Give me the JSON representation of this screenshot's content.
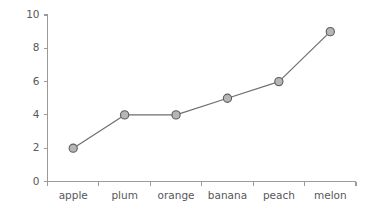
{
  "chart_data": {
    "type": "line",
    "title": "",
    "subtitle": "",
    "xlabel": "",
    "ylabel": "",
    "categories": [
      "apple",
      "plum",
      "orange",
      "banana",
      "peach",
      "melon"
    ],
    "values": [
      2,
      4,
      4,
      5,
      6,
      9
    ],
    "series": [
      {
        "name": "",
        "values": [
          2,
          4,
          4,
          5,
          6,
          9
        ]
      }
    ],
    "ylim": [
      0,
      10
    ],
    "ytick_labels": [
      "0",
      "2",
      "4",
      "6",
      "8",
      "10"
    ],
    "ytick_values": [
      0,
      2,
      4,
      6,
      8,
      10
    ],
    "xtick_labels": [
      "apple",
      "plum",
      "orange",
      "banana",
      "peach",
      "melon"
    ],
    "grid": false,
    "legend": null,
    "legend_position": "none",
    "marker": "circle",
    "annotations": []
  },
  "style": {
    "background": "#ffffff",
    "axis_color": "#9a9a9a",
    "line_color": "#6e6e6e",
    "marker_fill": "#b6b6b6",
    "marker_stroke": "#5d5d5d",
    "label_color": "#58585a"
  }
}
